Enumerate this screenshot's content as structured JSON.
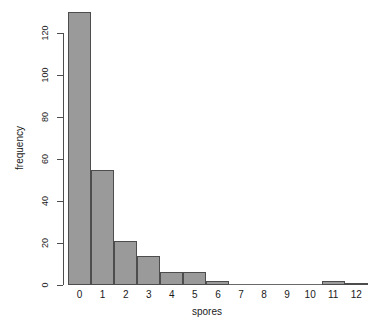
{
  "chart_data": {
    "type": "bar",
    "title": "",
    "subtitle": "",
    "xlabel": "spores",
    "ylabel": "frequency",
    "categories": [
      "0",
      "1",
      "2",
      "3",
      "4",
      "5",
      "6",
      "7",
      "8",
      "9",
      "10",
      "11",
      "12"
    ],
    "values": [
      130,
      55,
      21,
      14,
      6,
      6,
      2,
      0,
      0,
      0,
      0,
      2,
      1
    ],
    "series": [
      {
        "name": "frequency",
        "values": [
          130,
          55,
          21,
          14,
          6,
          6,
          2,
          0,
          0,
          0,
          0,
          2,
          1
        ]
      }
    ],
    "ylim": [
      0,
      132
    ],
    "xlim": [
      0,
      13
    ],
    "y_ticks": [
      0,
      20,
      40,
      60,
      80,
      100,
      120
    ],
    "y_tick_labels": [
      "0",
      "20",
      "40",
      "60",
      "80",
      "100",
      "120"
    ],
    "grid": false,
    "legend": null,
    "legend_position": "none",
    "annotations": [],
    "bar_fill_color": "#9a9a9a",
    "bar_border_color": "#4d4d4d",
    "axis_color": "#4d4d4d",
    "background_color": "#ffffff",
    "text_color": "#1a1a1a"
  }
}
